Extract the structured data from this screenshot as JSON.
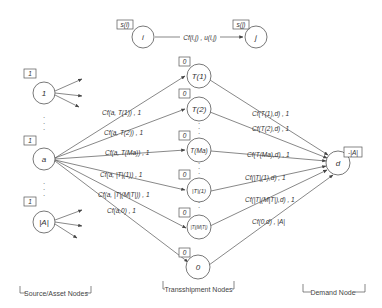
{
  "legend_edge": {
    "from": {
      "label": "i",
      "supply": "s(i)"
    },
    "to": {
      "label": "j",
      "supply": "s(j)"
    },
    "edge_label": "Cf(i,j) , u(i,j)"
  },
  "source_nodes": [
    {
      "label": "1",
      "supply": "1"
    },
    {
      "label": "a",
      "supply": "1"
    },
    {
      "label": "|A|",
      "supply": "1"
    }
  ],
  "transshipment_nodes": [
    {
      "label": "T(1)",
      "supply": "0"
    },
    {
      "label": "T(2)",
      "supply": "0"
    },
    {
      "label": "T(Ma)",
      "supply": "0"
    },
    {
      "label": "|T|(1)",
      "supply": "0"
    },
    {
      "label": "|T|(M|T|)",
      "supply": "0"
    },
    {
      "label": "0",
      "supply": "0"
    }
  ],
  "demand_node": {
    "label": "d",
    "supply": "-|A|"
  },
  "source_edges": [
    {
      "label": "Cf(a, T(1)) , 1"
    },
    {
      "label": "Cf(a, T(2)) , 1"
    },
    {
      "label": "Cf(a, T(Ma)) , 1"
    },
    {
      "label": "Cf(a, |T|(1)) , 1"
    },
    {
      "label": "Cf(a, |T|(M|T|)) , 1"
    },
    {
      "label": "Cf(a,0) , 1"
    }
  ],
  "demand_edges": [
    {
      "label": "Cf(T(1),d) , 1"
    },
    {
      "label": "Cf(T(2),d) , 1"
    },
    {
      "label": "Cf(T(Ma),d) , 1"
    },
    {
      "label": "Cf(|T|(1),d) , 1"
    },
    {
      "label": "Cf(|T|(M|T|),d) , 1"
    },
    {
      "label": "Cf(0,d) , |A|"
    }
  ],
  "groups": {
    "source": "Source/Asset Nodes",
    "transshipment": "Transshipment Nodes",
    "demand": "Demand Node"
  },
  "colors": {
    "stroke": "#555555",
    "text": "#333333",
    "background": "#ffffff"
  }
}
